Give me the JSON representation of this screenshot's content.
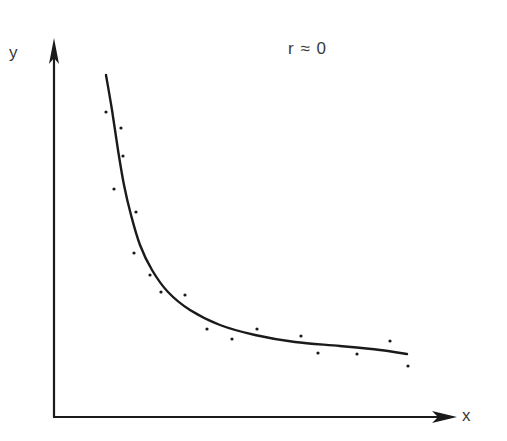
{
  "chart_data": {
    "type": "scatter",
    "title": "",
    "xlabel": "x",
    "ylabel": "y",
    "annotation": "r ≈ 0",
    "grid": false,
    "legend": null,
    "axis_ticks": "none",
    "points_pixel": [
      [
        106,
        112
      ],
      [
        121,
        128
      ],
      [
        123,
        156
      ],
      [
        114,
        189
      ],
      [
        136,
        212
      ],
      [
        134,
        253
      ],
      [
        150,
        275
      ],
      [
        161,
        292
      ],
      [
        185,
        295
      ],
      [
        207,
        329
      ],
      [
        232,
        339
      ],
      [
        257,
        329
      ],
      [
        301,
        336
      ],
      [
        318,
        353
      ],
      [
        357,
        354
      ],
      [
        390,
        341
      ],
      [
        408,
        366
      ]
    ],
    "curve_pixel": [
      [
        106,
        75
      ],
      [
        112,
        110
      ],
      [
        118,
        150
      ],
      [
        124,
        185
      ],
      [
        131,
        215
      ],
      [
        140,
        245
      ],
      [
        152,
        270
      ],
      [
        168,
        292
      ],
      [
        190,
        310
      ],
      [
        220,
        325
      ],
      [
        255,
        335
      ],
      [
        295,
        342
      ],
      [
        340,
        346
      ],
      [
        380,
        350
      ],
      [
        407,
        354
      ]
    ],
    "colors": {
      "ink": "#1a1a1a",
      "text": "#3a3a3a",
      "background": "#ffffff"
    }
  },
  "labels": {
    "x_axis": "x",
    "y_axis": "y",
    "annotation": "r ≈ 0"
  }
}
